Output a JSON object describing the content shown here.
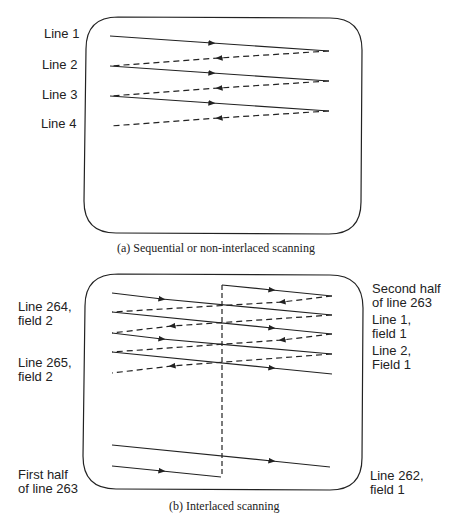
{
  "diagram_a": {
    "caption": "(a)  Sequential or non-interlaced scanning",
    "labels": [
      "Line 1",
      "Line 2",
      "Line 3",
      "Line 4"
    ]
  },
  "diagram_b": {
    "caption": "(b)  Interlaced scanning",
    "left_labels": [
      "Line 264,\nfield 2",
      "Line 265,\nfield 2",
      "First half\nof line 263"
    ],
    "right_labels": [
      "Second half\nof line 263",
      "Line 1,\nfield 1",
      "Line 2,\nField 1",
      "Line 262,\nfield 1"
    ]
  },
  "colors": {
    "stroke": "#222222",
    "background": "#ffffff"
  }
}
